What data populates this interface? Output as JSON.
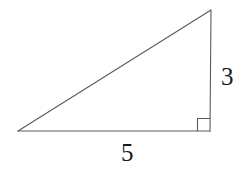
{
  "figure": {
    "kind": "right-triangle-diagram",
    "canvas": {
      "width": 241,
      "height": 171
    },
    "background_color": "#ffffff",
    "stroke_color": "#5a5a5a",
    "stroke_width": 1.1,
    "label_color": "#1a1a1a",
    "vertices": {
      "left": {
        "x": 18,
        "y": 131
      },
      "bottom_right": {
        "x": 210,
        "y": 131
      },
      "apex": {
        "x": 211,
        "y": 10
      }
    },
    "sides": [
      {
        "name": "horizontal-leg",
        "from": {
          "x": 18,
          "y": 131
        },
        "to": {
          "x": 210,
          "y": 131
        },
        "label": "5"
      },
      {
        "name": "vertical-leg",
        "from": {
          "x": 210,
          "y": 131
        },
        "to": {
          "x": 211,
          "y": 10
        },
        "label": "3"
      },
      {
        "name": "hypotenuse",
        "from": {
          "x": 18,
          "y": 131
        },
        "to": {
          "x": 211,
          "y": 10
        },
        "label": ""
      }
    ],
    "right_angle_marker": {
      "at_vertex": "bottom_right",
      "x": 197.5,
      "y": 118.5,
      "size": 12.5
    },
    "labels": {
      "vertical_side": "3",
      "horizontal_side": "5"
    }
  }
}
